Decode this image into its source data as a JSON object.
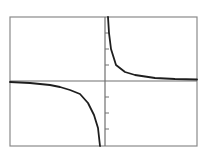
{
  "chart_data": {
    "type": "line",
    "title": "",
    "xlabel": "",
    "ylabel": "",
    "function": "y = 1/x",
    "grid": false,
    "legend": null,
    "xlim": [
      -6,
      6
    ],
    "ylim": [
      -4,
      4
    ],
    "y_ticks": [
      -3,
      -2,
      -1,
      1,
      2,
      3
    ],
    "x_ticks": [],
    "series": [
      {
        "name": "left branch (x<0)",
        "x": [
          -6,
          -4,
          -2,
          -1,
          -0.5,
          -0.25
        ],
        "y": [
          -0.167,
          -0.25,
          -0.5,
          -1,
          -2,
          -4
        ]
      },
      {
        "name": "right branch (x>0)",
        "x": [
          0.25,
          0.5,
          1,
          2,
          4,
          6
        ],
        "y": [
          4,
          2,
          1,
          0.5,
          0.25,
          0.167
        ]
      }
    ]
  },
  "colors": {
    "frame": "#8a8a8a",
    "axis": "#707070",
    "curve": "#1e1e1e",
    "background": "#ffffff"
  },
  "layout": {
    "frame": {
      "left": 10,
      "top": 17,
      "right": 197,
      "bottom": 146
    },
    "origin": {
      "x": 105,
      "y": 81
    },
    "tick_spacing_px": 16,
    "upper_branch_px": [
      [
        108,
        17
      ],
      [
        109,
        33
      ],
      [
        111,
        49
      ],
      [
        116,
        65
      ],
      [
        125,
        72
      ],
      [
        135,
        75
      ],
      [
        155,
        78
      ],
      [
        175,
        79
      ],
      [
        197,
        79.5
      ]
    ],
    "lower_branch_px": [
      [
        10,
        82
      ],
      [
        30,
        83
      ],
      [
        50,
        85
      ],
      [
        60,
        87
      ],
      [
        70,
        90
      ],
      [
        80,
        94
      ],
      [
        88,
        103
      ],
      [
        94,
        115
      ],
      [
        98,
        128
      ],
      [
        100,
        146
      ]
    ]
  }
}
